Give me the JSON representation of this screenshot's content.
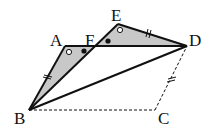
{
  "diagram": {
    "points": {
      "A": {
        "label": "A",
        "x": 65,
        "y": 46
      },
      "F": {
        "label": "F",
        "x": 95,
        "y": 46
      },
      "E": {
        "label": "E",
        "x": 118,
        "y": 24
      },
      "D": {
        "label": "D",
        "x": 187,
        "y": 46
      },
      "B": {
        "label": "B",
        "x": 29,
        "y": 110
      },
      "C": {
        "label": "C",
        "x": 155,
        "y": 110
      }
    },
    "shaded_triangles": [
      "ABF",
      "EFD"
    ],
    "solid_segments": [
      "AB",
      "AD",
      "BE",
      "ED",
      "BD"
    ],
    "dashed_segments": [
      "BC",
      "CD"
    ],
    "equal_marks": [
      "AB",
      "ED",
      "CD"
    ],
    "angle_marks": {
      "open_circle": [
        "A",
        "E"
      ],
      "filled_circle": [
        "F-AFB",
        "F-EFD"
      ]
    },
    "colors": {
      "shade": "#c8c8c8",
      "line": "#111111"
    }
  }
}
